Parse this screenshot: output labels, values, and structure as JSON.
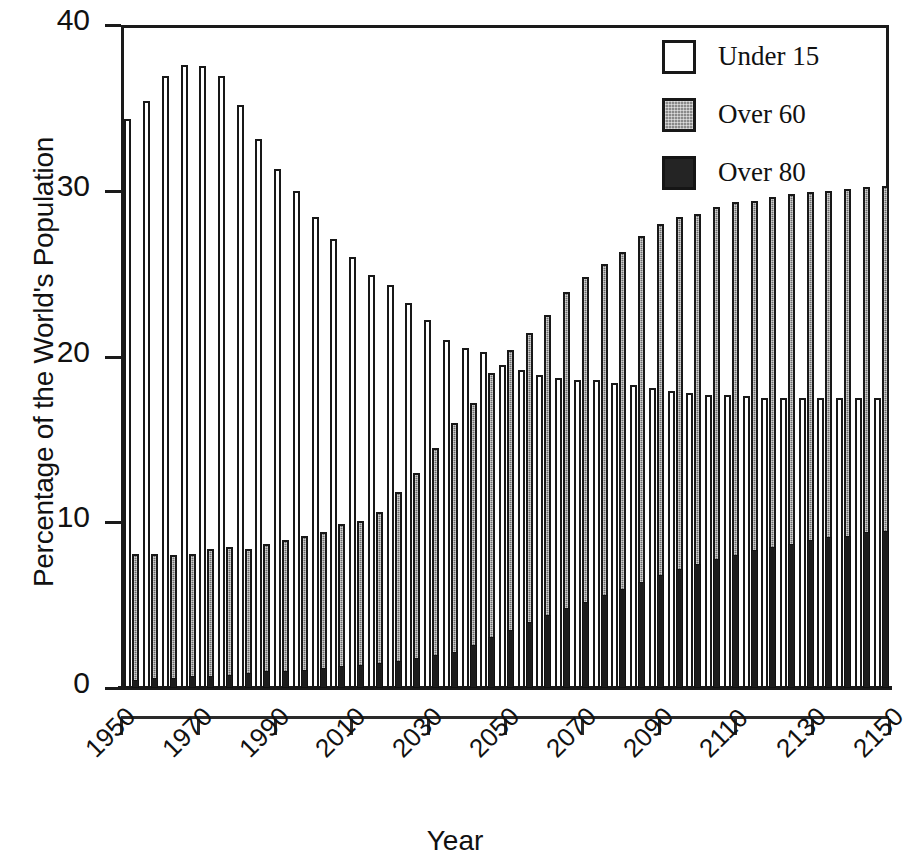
{
  "chart_data": {
    "type": "bar",
    "title": "",
    "xlabel": "Year",
    "ylabel": "Percentage of the World's Population",
    "ylim": [
      0,
      40
    ],
    "yticks": [
      0,
      10,
      20,
      30,
      40
    ],
    "xlim": [
      1950,
      2150
    ],
    "xticks": [
      1950,
      1970,
      1990,
      2010,
      2030,
      2050,
      2070,
      2090,
      2110,
      2130,
      2150
    ],
    "grid": false,
    "legend_position": "top-right",
    "bar_interval_years": 5,
    "categories": [
      1950,
      1955,
      1960,
      1965,
      1970,
      1975,
      1980,
      1985,
      1990,
      1995,
      2000,
      2005,
      2010,
      2015,
      2020,
      2025,
      2030,
      2035,
      2040,
      2045,
      2050,
      2055,
      2060,
      2065,
      2070,
      2075,
      2080,
      2085,
      2090,
      2095,
      2100,
      2105,
      2110,
      2115,
      2120,
      2125,
      2130,
      2135,
      2140,
      2145,
      2150
    ],
    "series": [
      {
        "name": "Under 15",
        "color": "#ffffff",
        "fill": "open",
        "values": [
          34.3,
          35.4,
          36.9,
          37.6,
          37.5,
          36.9,
          35.2,
          33.1,
          31.3,
          30.0,
          28.4,
          27.1,
          26.0,
          24.9,
          24.3,
          23.2,
          22.2,
          21.0,
          20.5,
          20.3,
          19.5,
          19.2,
          18.9,
          18.7,
          18.6,
          18.6,
          18.4,
          18.3,
          18.1,
          17.9,
          17.8,
          17.7,
          17.7,
          17.6,
          17.5,
          17.5,
          17.5,
          17.5,
          17.5,
          17.5,
          17.5
        ]
      },
      {
        "name": "Over 60",
        "color": "#6e6e6e",
        "fill": "stipple",
        "values": [
          8.1,
          8.1,
          8.0,
          8.1,
          8.4,
          8.5,
          8.4,
          8.7,
          8.9,
          9.2,
          9.4,
          9.9,
          10.1,
          10.6,
          11.8,
          13.0,
          14.5,
          16.0,
          17.2,
          19.0,
          20.4,
          21.4,
          22.5,
          23.9,
          24.8,
          25.6,
          26.3,
          27.3,
          28.0,
          28.4,
          28.6,
          29.0,
          29.3,
          29.4,
          29.6,
          29.8,
          29.9,
          30.0,
          30.1,
          30.2,
          30.3
        ]
      },
      {
        "name": "Over 80",
        "color": "#1c1c1c",
        "fill": "solid",
        "values": [
          0.5,
          0.6,
          0.6,
          0.7,
          0.7,
          0.8,
          0.9,
          1.0,
          1.0,
          1.1,
          1.2,
          1.3,
          1.4,
          1.5,
          1.6,
          1.8,
          2.0,
          2.2,
          2.6,
          3.1,
          3.5,
          4.0,
          4.4,
          4.8,
          5.2,
          5.6,
          6.0,
          6.4,
          6.8,
          7.2,
          7.5,
          7.8,
          8.0,
          8.3,
          8.5,
          8.7,
          8.9,
          9.1,
          9.2,
          9.4,
          9.5
        ]
      }
    ],
    "legend": [
      {
        "label": "Under 15",
        "swatch": "open-square"
      },
      {
        "label": "Over 60",
        "swatch": "stippled-square"
      },
      {
        "label": "Over 80",
        "swatch": "filled-square"
      }
    ]
  }
}
